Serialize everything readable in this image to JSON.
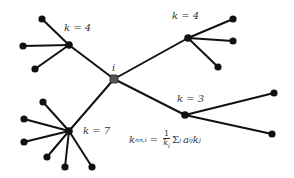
{
  "diagram": {
    "colors": {
      "edge": "#111111",
      "node": "#111111",
      "center_node": "#555555",
      "text": "#333333"
    },
    "center": {
      "id": "i",
      "label": "i",
      "x": 114,
      "y": 79,
      "label_x": 112,
      "label_y": 63
    },
    "hubs": [
      {
        "id": "h1",
        "x": 69,
        "y": 45,
        "label": "k = 4",
        "label_x": 64,
        "label_y": 23,
        "leaves": [
          [
            42,
            19
          ],
          [
            23,
            46
          ],
          [
            35,
            69
          ]
        ]
      },
      {
        "id": "h2",
        "x": 188,
        "y": 38,
        "label": "k = 4",
        "label_x": 172,
        "label_y": 11,
        "leaves": [
          [
            233,
            19
          ],
          [
            233,
            41
          ],
          [
            218,
            67
          ]
        ]
      },
      {
        "id": "h3",
        "x": 185,
        "y": 115,
        "label": "k = 3",
        "label_x": 177,
        "label_y": 94,
        "leaves": [
          [
            274,
            93
          ],
          [
            272,
            134
          ]
        ]
      },
      {
        "id": "h4",
        "x": 69,
        "y": 131,
        "label": "k = 7",
        "label_x": 83,
        "label_y": 126,
        "leaves": [
          [
            43,
            102
          ],
          [
            24,
            119
          ],
          [
            24,
            142
          ],
          [
            47,
            157
          ],
          [
            65,
            167
          ],
          [
            92,
            167
          ]
        ]
      }
    ],
    "formula": {
      "lhs": "k",
      "lhs_sub": "nn,i",
      "equals": "=",
      "numerator": "1",
      "denominator": "k",
      "denominator_sub": "i",
      "sum": "Σ",
      "sum_sub": "j",
      "a": "a",
      "a_sub": "ij",
      "k": "k",
      "k_sub": "j"
    }
  }
}
